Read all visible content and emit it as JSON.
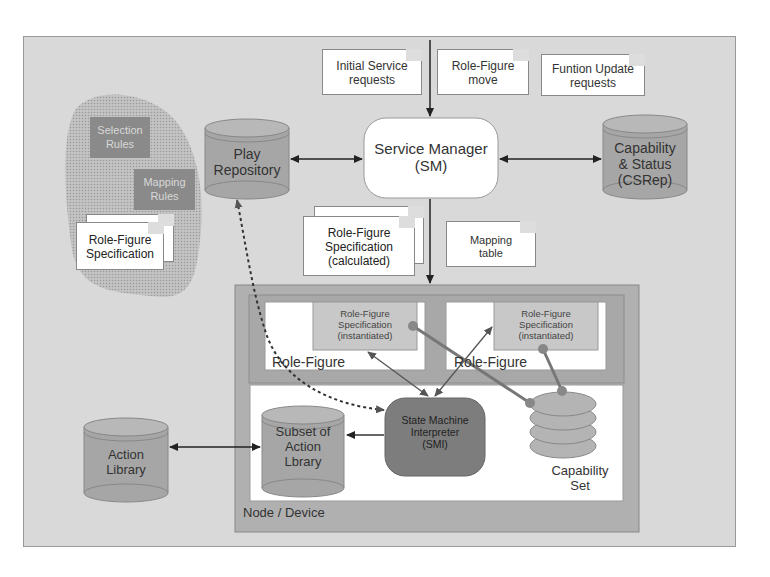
{
  "diagram": {
    "type": "architecture",
    "colors": {
      "background": "#d9d9d9",
      "repository": "#a6a6a6",
      "node": "#b0b0b0",
      "panel_white": "#ffffff",
      "spec_box": "#c8c8c8",
      "smi": "#7d7d7d",
      "rule_box": "#8a8a8a"
    },
    "requests": [
      {
        "id": "initial",
        "label_line1": "Initial Service",
        "label_line2": "requests"
      },
      {
        "id": "move",
        "label_line1": "Role-Figure",
        "label_line2": "move"
      },
      {
        "id": "update",
        "label_line1": "Funtion Update",
        "label_line2": "requests"
      }
    ],
    "service_manager": {
      "line1": "Service Manager",
      "line2": "(SM)"
    },
    "play_repository": {
      "line1": "Play",
      "line2": "Repository"
    },
    "capability_status": {
      "line1": "Capability",
      "line2": "& Status",
      "line3": "(CSRep)"
    },
    "rules_region": {
      "selection_rules": {
        "line1": "Selection",
        "line2": "Rules"
      },
      "mapping_rules": {
        "line1": "Mapping",
        "line2": "Rules"
      },
      "spec_doc": {
        "line1": "Role-Figure",
        "line2": "Specification"
      }
    },
    "calculated_spec": {
      "line1": "Role-Figure",
      "line2": "Specification",
      "line3": "(calculated)"
    },
    "mapping_table": {
      "line1": "Mapping",
      "line2": "table"
    },
    "node": {
      "label": "Node / Device",
      "role_figures": [
        {
          "label": "Role-Figure",
          "spec_line1": "Role-Figure",
          "spec_line2": "Specification",
          "spec_line3": "(instantiated)"
        },
        {
          "label": "Role-Figure",
          "spec_line1": "Role-Figure",
          "spec_line2": "Specification",
          "spec_line3": "(instantiated)"
        }
      ],
      "smi": {
        "line1": "State Machine",
        "line2": "Interpreter",
        "line3": "(SMI)"
      },
      "subset_action_library": {
        "line1": "Subset of",
        "line2": "Action",
        "line3": "Lbrary"
      },
      "capability_set": {
        "line1": "Capability",
        "line2": "Set"
      }
    },
    "action_library": {
      "line1": "Action",
      "line2": "Library"
    }
  }
}
